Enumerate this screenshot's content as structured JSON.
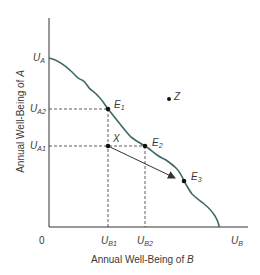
{
  "diagram": {
    "type": "utility-possibility-frontier",
    "colors": {
      "curve": "#3d6b67",
      "axis": "#333333",
      "dashed": "#333333",
      "text": "#3a3a3a",
      "point": "#111111"
    },
    "axes": {
      "y_title": "Annual Well-Being of A",
      "x_title": "Annual Well-Being of B",
      "x_title_prefix": "Annual Well-Being of ",
      "x_title_var": "B",
      "y_title_prefix": "Annual Well-Being of ",
      "y_title_var": "A",
      "origin": "0"
    },
    "y_labels": {
      "ua": {
        "main": "U",
        "sub": "A"
      },
      "ua2": {
        "main": "U",
        "sub": "A2"
      },
      "ua1": {
        "main": "U",
        "sub": "A1"
      }
    },
    "x_labels": {
      "ub1": {
        "main": "U",
        "sub": "B1"
      },
      "ub2": {
        "main": "U",
        "sub": "B2"
      },
      "ub": {
        "main": "U",
        "sub": "B"
      }
    },
    "points": {
      "e1": {
        "main": "E",
        "sub": "1"
      },
      "e2": {
        "main": "E",
        "sub": "2"
      },
      "e3": {
        "main": "E",
        "sub": "3"
      },
      "x": {
        "main": "X"
      },
      "z": {
        "main": "Z"
      }
    }
  }
}
